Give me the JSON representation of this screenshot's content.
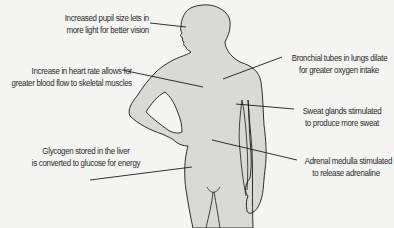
{
  "diagram": {
    "title": "",
    "type": "annotated-body-silhouette",
    "colors": {
      "background": "#f4f4f3",
      "body_fill": "#d9d9d8",
      "outline": "#1a1a1a",
      "leader_line": "#1a1a1a",
      "text": "#2a2a2a"
    },
    "annotations": [
      {
        "id": "pupil",
        "lines": [
          "Increased pupil size lets in",
          "more light for better vision"
        ],
        "target": "eye"
      },
      {
        "id": "bronchial",
        "lines": [
          "Bronchial tubes in lungs dilate",
          "for greater oxygen intake"
        ],
        "target": "lungs"
      },
      {
        "id": "heart",
        "lines": [
          "Increase in heart rate allows for",
          "greater blood flow to skeletal muscles"
        ],
        "target": "heart"
      },
      {
        "id": "sweat",
        "lines": [
          "Sweat glands stimulated",
          "to produce more sweat"
        ],
        "target": "skin"
      },
      {
        "id": "glycogen",
        "lines": [
          "Glycogen stored in the liver",
          "is converted to glucose for energy"
        ],
        "target": "liver"
      },
      {
        "id": "adrenal",
        "lines": [
          "Adrenal medulla stimulated",
          "to release adrenaline"
        ],
        "target": "adrenal-gland"
      }
    ]
  }
}
